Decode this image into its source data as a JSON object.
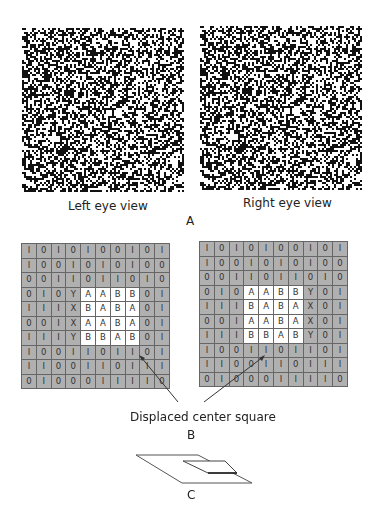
{
  "panel_a": {
    "left_caption": "Left eye view",
    "right_caption": "Right eye view",
    "label": "A"
  },
  "panel_b": {
    "label": "B",
    "annotation": "Displaced center square",
    "left_grid": [
      [
        "1",
        "0",
        "1",
        "0",
        "1",
        "0",
        "0",
        "1",
        "0",
        "1"
      ],
      [
        "1",
        "0",
        "0",
        "1",
        "0",
        "1",
        "0",
        "1",
        "0",
        "0"
      ],
      [
        "0",
        "0",
        "1",
        "1",
        "0",
        "1",
        "1",
        "0",
        "1",
        "0"
      ],
      [
        "0",
        "1",
        "0",
        "Y",
        "A",
        "A",
        "B",
        "B",
        "0",
        "1"
      ],
      [
        "1",
        "1",
        "1",
        "X",
        "B",
        "A",
        "B",
        "A",
        "0",
        "1"
      ],
      [
        "0",
        "0",
        "1",
        "X",
        "A",
        "A",
        "B",
        "A",
        "0",
        "1"
      ],
      [
        "1",
        "1",
        "1",
        "Y",
        "B",
        "B",
        "A",
        "B",
        "0",
        "1"
      ],
      [
        "1",
        "0",
        "0",
        "1",
        "1",
        "0",
        "1",
        "1",
        "0",
        "1"
      ],
      [
        "1",
        "1",
        "0",
        "0",
        "1",
        "1",
        "0",
        "1",
        "1",
        "1"
      ],
      [
        "0",
        "1",
        "0",
        "0",
        "0",
        "1",
        "1",
        "1",
        "1",
        "0"
      ]
    ],
    "right_grid": [
      [
        "1",
        "0",
        "1",
        "0",
        "1",
        "0",
        "0",
        "1",
        "0",
        "1"
      ],
      [
        "1",
        "0",
        "0",
        "1",
        "0",
        "1",
        "0",
        "1",
        "0",
        "0"
      ],
      [
        "0",
        "0",
        "1",
        "1",
        "0",
        "1",
        "1",
        "0",
        "1",
        "0"
      ],
      [
        "0",
        "1",
        "0",
        "A",
        "A",
        "B",
        "B",
        "Y",
        "0",
        "1"
      ],
      [
        "1",
        "1",
        "1",
        "B",
        "A",
        "B",
        "A",
        "X",
        "0",
        "1"
      ],
      [
        "0",
        "0",
        "1",
        "A",
        "A",
        "B",
        "A",
        "X",
        "0",
        "1"
      ],
      [
        "1",
        "1",
        "1",
        "B",
        "B",
        "A",
        "B",
        "Y",
        "0",
        "1"
      ],
      [
        "1",
        "0",
        "0",
        "1",
        "1",
        "0",
        "1",
        "1",
        "0",
        "1"
      ],
      [
        "1",
        "1",
        "0",
        "0",
        "1",
        "1",
        "0",
        "1",
        "1",
        "1"
      ],
      [
        "0",
        "1",
        "0",
        "0",
        "0",
        "1",
        "1",
        "1",
        "1",
        "0"
      ]
    ]
  },
  "panel_c": {
    "label": "C"
  }
}
